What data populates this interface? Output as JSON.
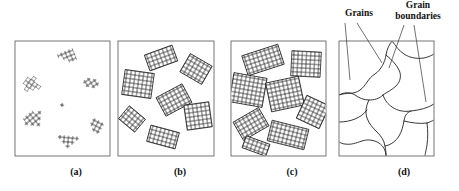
{
  "figure": {
    "background": "#ffffff",
    "line_color": "#222222",
    "box_color": "#555555",
    "width": 459,
    "height": 191
  },
  "annotations": {
    "grains": "Grains",
    "grain_boundaries_line1": "Grain",
    "grain_boundaries_line2": "boundaries"
  },
  "captions": {
    "a": "(a)",
    "b": "(b)",
    "c": "(c)",
    "d": "(d)"
  },
  "panels": [
    {
      "id": "a",
      "caption": "(a)",
      "stage": "nucleation",
      "description": "Small crystallite nuclei of randomly oriented unit cells scattered in liquid",
      "box": {
        "x": 15,
        "y": 41,
        "w": 95,
        "h": 115
      },
      "cell_size": 4.2,
      "clusters": [
        {
          "cx": 67,
          "cy": 57,
          "angle": -22,
          "cols": 4,
          "rows": 3,
          "pattern": "step"
        },
        {
          "cx": 32,
          "cy": 85,
          "angle": 35,
          "cols": 3,
          "rows": 3,
          "pattern": "cross"
        },
        {
          "cx": 91,
          "cy": 83,
          "angle": -35,
          "cols": 3,
          "rows": 3,
          "pattern": "diag"
        },
        {
          "cx": 62,
          "cy": 105,
          "angle": 10,
          "cols": 1,
          "rows": 1,
          "pattern": "single"
        },
        {
          "cx": 33,
          "cy": 118,
          "angle": -40,
          "cols": 4,
          "rows": 3,
          "pattern": "cross"
        },
        {
          "cx": 96,
          "cy": 126,
          "angle": 28,
          "cols": 3,
          "rows": 3,
          "pattern": "step"
        },
        {
          "cx": 68,
          "cy": 142,
          "angle": 5,
          "cols": 4,
          "rows": 3,
          "pattern": "tri"
        }
      ]
    },
    {
      "id": "b",
      "caption": "(b)",
      "stage": "growth",
      "description": "Growth of the crystallites; obstruction of some grains that are adjacent to one another is also shown",
      "box": {
        "x": 118,
        "y": 41,
        "w": 96,
        "h": 115
      },
      "cell_size": 4.2,
      "clusters": [
        {
          "cx": 161,
          "cy": 58,
          "angle": -20,
          "cols": 7,
          "rows": 4
        },
        {
          "cx": 196,
          "cy": 69,
          "angle": 30,
          "cols": 6,
          "rows": 5
        },
        {
          "cx": 138,
          "cy": 82,
          "angle": 8,
          "cols": 7,
          "rows": 6
        },
        {
          "cx": 173,
          "cy": 100,
          "angle": -28,
          "cols": 7,
          "rows": 5
        },
        {
          "cx": 132,
          "cy": 118,
          "angle": 40,
          "cols": 5,
          "rows": 4
        },
        {
          "cx": 198,
          "cy": 115,
          "angle": -8,
          "cols": 6,
          "rows": 6
        },
        {
          "cx": 163,
          "cy": 137,
          "angle": 15,
          "cols": 7,
          "rows": 4
        }
      ]
    },
    {
      "id": "c",
      "caption": "(c)",
      "stage": "impingement",
      "description": "Upon completion of solidification, grains having irregular shapes have formed",
      "box": {
        "x": 231,
        "y": 41,
        "w": 95,
        "h": 115
      },
      "cell_size": 4.2,
      "clusters": [
        {
          "cx": 262,
          "cy": 58,
          "angle": -18,
          "cols": 9,
          "rows": 5
        },
        {
          "cx": 305,
          "cy": 63,
          "angle": 4,
          "cols": 7,
          "rows": 6
        },
        {
          "cx": 248,
          "cy": 88,
          "angle": 10,
          "cols": 8,
          "rows": 7
        },
        {
          "cx": 284,
          "cy": 92,
          "angle": -12,
          "cols": 8,
          "rows": 7
        },
        {
          "cx": 313,
          "cy": 110,
          "angle": 25,
          "cols": 6,
          "rows": 6
        },
        {
          "cx": 250,
          "cy": 122,
          "angle": -30,
          "cols": 7,
          "rows": 5
        },
        {
          "cx": 287,
          "cy": 133,
          "angle": 14,
          "cols": 9,
          "rows": 5
        },
        {
          "cx": 258,
          "cy": 143,
          "angle": 20,
          "cols": 6,
          "rows": 3
        }
      ]
    },
    {
      "id": "d",
      "caption": "(d)",
      "stage": "grain structure",
      "description": "The grain structure as it would appear under the microscope; dark lines are the grain boundaries",
      "box": {
        "x": 339,
        "y": 41,
        "w": 95,
        "h": 115
      },
      "grain_count": 9
    }
  ],
  "leader_lines": {
    "grains": [
      {
        "from": [
          345,
          22
        ],
        "to": [
          350,
          80
        ]
      },
      {
        "from": [
          358,
          22
        ],
        "to": [
          383,
          62
        ]
      }
    ],
    "grain_boundaries": [
      {
        "from": [
          405,
          24
        ],
        "to": [
          389,
          67
        ]
      },
      {
        "from": [
          415,
          24
        ],
        "to": [
          425,
          100
        ]
      }
    ]
  }
}
